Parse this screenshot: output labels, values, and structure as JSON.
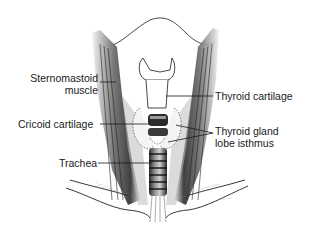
{
  "figure": {
    "labels": {
      "sternomastoid_line1": "Sternomastoid",
      "sternomastoid_line2": "muscle",
      "cricoid": "Cricoid cartilage",
      "trachea": "Trachea",
      "thyroid_cartilage": "Thyroid cartilage",
      "thyroid_gland_line1": "Thyroid gland",
      "thyroid_gland_line2": "lobe isthmus"
    },
    "colors": {
      "ink": "#1a1a1a",
      "background": "#ffffff",
      "shade": "#8a8a8a"
    }
  }
}
